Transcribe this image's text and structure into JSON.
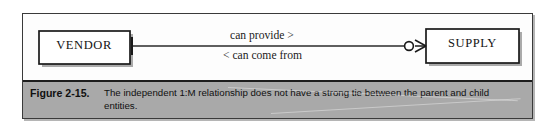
{
  "figure": {
    "number_label": "Figure 2-15.",
    "caption": "The independent 1:M relationship does not have a strong tie between the parent and child entities."
  },
  "diagram": {
    "type": "entity-relationship-diagram",
    "entities": [
      {
        "id": "vendor",
        "label": "VENDOR",
        "role": "parent"
      },
      {
        "id": "supply",
        "label": "SUPPLY",
        "role": "child"
      }
    ],
    "relationship": {
      "label_above": "can provide >",
      "label_below": "< can come from",
      "cardinality": "1:M",
      "parent_symbol": "one-tick",
      "child_symbol": "optional-circle-crowsfoot"
    }
  },
  "colors": {
    "frame_border": "#3a3a3a",
    "caption_band": "#a9a9a9",
    "caption_rule": "#1d1d1d",
    "entity_border": "#1a1a1a",
    "page_background": "#ffffff",
    "text": "#101010"
  }
}
